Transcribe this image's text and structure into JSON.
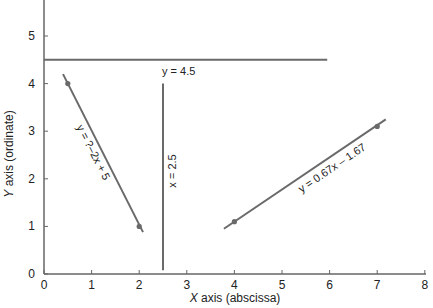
{
  "chart_data": {
    "type": "line",
    "title": "",
    "xlabel": "X axis (abscissa)",
    "xlabel_italic_part": "X",
    "xlabel_rest": " axis (abscissa)",
    "ylabel": "Y axis (ordinate)",
    "ylabel_italic_part": "Y",
    "ylabel_rest": " axis (ordinate)",
    "xlim": [
      0,
      8
    ],
    "ylim": [
      0,
      5.7
    ],
    "xticks": [
      0,
      1,
      2,
      3,
      4,
      5,
      6,
      7,
      8
    ],
    "yticks": [
      0,
      1,
      2,
      3,
      4,
      5
    ],
    "grid": false,
    "legend": null,
    "series": [
      {
        "name": "y = ?–2x + 5",
        "kind": "line",
        "x": [
          0.4,
          2.08
        ],
        "y": [
          4.2,
          0.88
        ],
        "points": [
          {
            "x": 0.5,
            "y": 4
          },
          {
            "x": 2,
            "y": 1
          }
        ],
        "label": "y = ?–2x + 5"
      },
      {
        "name": "y = 4.5",
        "kind": "horizontal",
        "x": [
          0,
          5.95
        ],
        "y": [
          4.5,
          4.5
        ],
        "label": "y = 4.5"
      },
      {
        "name": "x = 2.5",
        "kind": "vertical",
        "x": [
          2.5,
          2.5
        ],
        "y": [
          0.08,
          4.0
        ],
        "label": "x = 2.5"
      },
      {
        "name": "y = 0.67x – 1.67",
        "kind": "line",
        "x": [
          3.78,
          7.18
        ],
        "y": [
          0.95,
          3.25
        ],
        "points": [
          {
            "x": 4,
            "y": 1.1
          },
          {
            "x": 7,
            "y": 3.1
          }
        ],
        "label": "y = 0.67x – 1.67"
      }
    ],
    "colors": {
      "axis": "#666666",
      "line": "#6a6a6a",
      "marker": "#6a6a6a",
      "text": "#222222"
    }
  }
}
